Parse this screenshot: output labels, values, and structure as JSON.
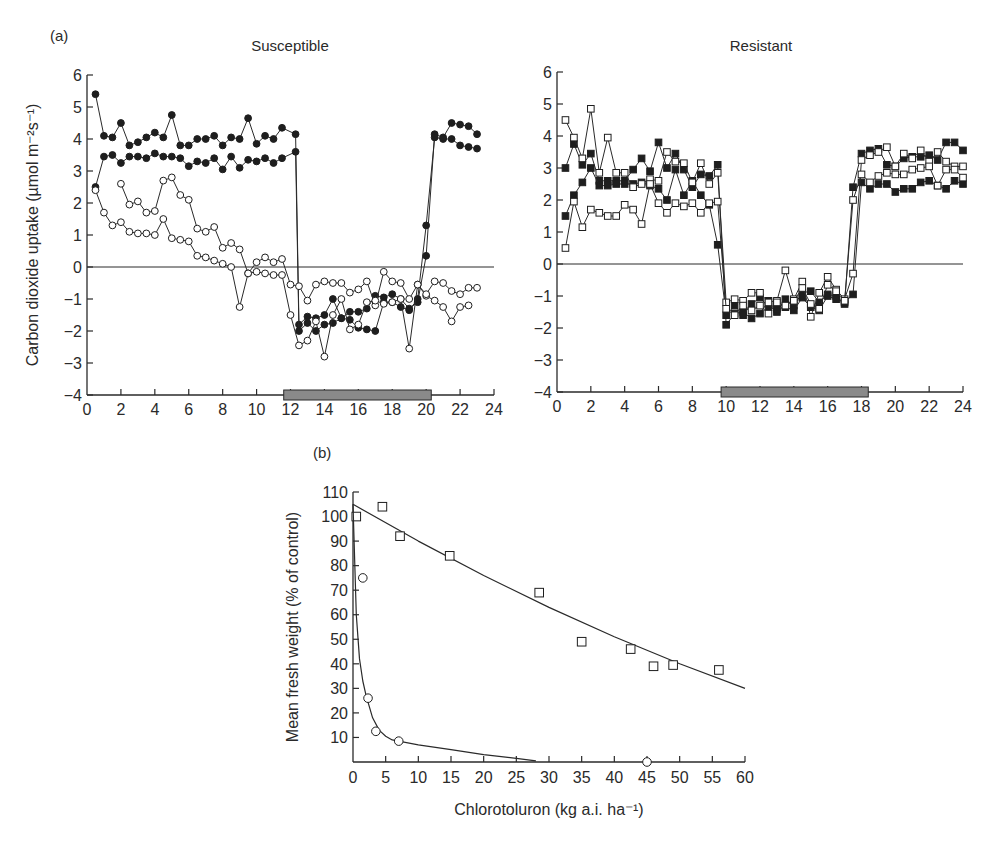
{
  "figure": {
    "panel_a_label": "(a)",
    "panel_b_label": "(b)"
  },
  "chart_data": [
    {
      "type": "line",
      "panel": "a-left",
      "title": "Susceptible",
      "ylabel": "Carbon dioxide uptake (µmol m⁻²s⁻¹)",
      "xlabel": "",
      "xlim": [
        0,
        24
      ],
      "ylim": [
        -4,
        6
      ],
      "xticks": [
        0,
        2,
        4,
        6,
        8,
        10,
        12,
        14,
        16,
        18,
        20,
        22,
        24
      ],
      "yticks": [
        6,
        5,
        4,
        3,
        2,
        1,
        0,
        -1,
        -2,
        -3,
        -4
      ],
      "dark_bar": [
        11.6,
        20.3
      ],
      "zero_line": true,
      "series": [
        {
          "name": "susceptible-filled-1",
          "marker": "filled-circle",
          "x": [
            0.5,
            1,
            1.5,
            2,
            2.5,
            3,
            3.5,
            4,
            4.5,
            5,
            5.5,
            6,
            6.5,
            7,
            7.5,
            8,
            8.5,
            9,
            9.5,
            10,
            10.5,
            11,
            11.5,
            12.3,
            12.5,
            13,
            13.5,
            14,
            14.5,
            15,
            15.5,
            16,
            16.5,
            17,
            17.5,
            18,
            18.5,
            19,
            19.5,
            20,
            20.5,
            21,
            21.5,
            22,
            22.5,
            23
          ],
          "y": [
            5.4,
            4.1,
            4.05,
            4.5,
            3.8,
            3.9,
            4.05,
            4.2,
            4.05,
            4.75,
            3.8,
            3.8,
            4.0,
            4.0,
            4.1,
            3.8,
            4.05,
            4.0,
            4.65,
            3.85,
            4.1,
            4.0,
            4.35,
            4.15,
            -1.8,
            -1.55,
            -1.6,
            -1.5,
            -1.0,
            -1.6,
            -1.4,
            -1.4,
            -1.3,
            -0.9,
            -0.95,
            -0.85,
            -1.0,
            -1.3,
            -1.1,
            0.35,
            4.15,
            4.05,
            4.5,
            4.45,
            4.4,
            4.15
          ]
        },
        {
          "name": "susceptible-filled-2",
          "marker": "filled-circle",
          "x": [
            0.5,
            1,
            1.5,
            2,
            2.5,
            3,
            3.5,
            4,
            4.5,
            5,
            5.5,
            6,
            6.5,
            7,
            7.5,
            8,
            8.5,
            9,
            9.5,
            10,
            10.5,
            11,
            11.5,
            12.3,
            12.5,
            13,
            13.5,
            14,
            14.5,
            15,
            15.5,
            16,
            16.5,
            17,
            17.5,
            18,
            18.5,
            19,
            19.5,
            20,
            20.5,
            21,
            21.5,
            22,
            22.5,
            23
          ],
          "y": [
            2.5,
            3.45,
            3.5,
            3.25,
            3.45,
            3.45,
            3.4,
            3.55,
            3.45,
            3.45,
            3.4,
            3.15,
            3.3,
            3.25,
            3.4,
            3.05,
            3.45,
            3.1,
            3.35,
            3.3,
            3.4,
            3.25,
            3.4,
            3.6,
            -2.0,
            -1.75,
            -2.0,
            -1.8,
            -1.75,
            -1.6,
            -1.65,
            -1.9,
            -1.95,
            -2.0,
            -1.1,
            -1.1,
            -1.25,
            -1.35,
            -1.0,
            1.3,
            4.05,
            4.0,
            4.0,
            3.8,
            3.75,
            3.7
          ]
        },
        {
          "name": "susceptible-open-1",
          "marker": "open-circle",
          "x": [
            2,
            2.5,
            3,
            3.5,
            4,
            4.5,
            5,
            5.5,
            6,
            6.5,
            7,
            7.5,
            8,
            8.5,
            9,
            9.5,
            10,
            10.5,
            11,
            11.5,
            12,
            12.5,
            13,
            13.5,
            14,
            14.5,
            15,
            15.5,
            16,
            16.5,
            17,
            17.5,
            18,
            18.5,
            19,
            19.5,
            20,
            20.5,
            21,
            21.5,
            22,
            22.5,
            23
          ],
          "y": [
            2.6,
            1.95,
            2.05,
            1.7,
            1.75,
            2.7,
            2.8,
            2.25,
            2.1,
            1.2,
            1.1,
            1.25,
            0.6,
            0.75,
            0.55,
            -0.2,
            0.15,
            0.3,
            0.15,
            0.25,
            -0.55,
            -0.6,
            -1.05,
            -0.55,
            -0.45,
            -0.5,
            -0.5,
            -0.8,
            -0.7,
            -0.45,
            -1.2,
            -0.15,
            -0.45,
            -0.5,
            -1.0,
            -0.55,
            -0.9,
            -1.05,
            -1.25,
            -1.7,
            -1.25,
            -1.2,
            null
          ]
        },
        {
          "name": "susceptible-open-2",
          "marker": "open-circle",
          "x": [
            0.5,
            1,
            1.5,
            2,
            2.5,
            3,
            3.5,
            4,
            4.5,
            5,
            5.5,
            6,
            6.5,
            7,
            7.5,
            8,
            8.5,
            9,
            9.5,
            10,
            10.5,
            11,
            11.5,
            12,
            12.5,
            13,
            13.5,
            14,
            14.5,
            15,
            15.5,
            16,
            16.5,
            17,
            17.5,
            18,
            18.5,
            19,
            19.5,
            20,
            20.5,
            21,
            21.5,
            22,
            22.5,
            23
          ],
          "y": [
            2.4,
            1.7,
            1.3,
            1.4,
            1.1,
            1.05,
            1.05,
            1.0,
            1.5,
            0.9,
            0.85,
            0.8,
            0.35,
            0.3,
            0.2,
            0.1,
            0.0,
            -1.25,
            -0.2,
            -0.15,
            -0.2,
            -0.25,
            -0.25,
            -1.5,
            -2.45,
            -2.3,
            -1.7,
            -2.8,
            -1.5,
            -1.0,
            -1.95,
            -1.8,
            -1.1,
            -1.05,
            -1.15,
            -1.1,
            -1.0,
            -2.55,
            -0.55,
            -0.85,
            -0.45,
            -0.5,
            -0.75,
            -0.85,
            -0.65,
            -0.65
          ]
        }
      ]
    },
    {
      "type": "line",
      "panel": "a-right",
      "title": "Resistant",
      "ylabel": "",
      "xlim": [
        0,
        24
      ],
      "ylim": [
        -4,
        6
      ],
      "xticks": [
        0,
        2,
        4,
        6,
        8,
        10,
        12,
        14,
        16,
        18,
        20,
        22,
        24
      ],
      "yticks": [
        6,
        5,
        4,
        3,
        2,
        1,
        0,
        -1,
        -2,
        -3,
        -4
      ],
      "dark_bar": [
        9.7,
        18.4
      ],
      "zero_line": true,
      "series": [
        {
          "name": "resistant-filled-1",
          "marker": "filled-square",
          "x": [
            0.5,
            1,
            1.5,
            2,
            2.5,
            3,
            3.5,
            4,
            4.5,
            5,
            5.5,
            6,
            6.5,
            7,
            7.5,
            8,
            8.5,
            9,
            9.5,
            10,
            10.5,
            11,
            11.5,
            12,
            12.5,
            13,
            13.5,
            14,
            14.5,
            15,
            15.5,
            16,
            16.5,
            17,
            17.5,
            18,
            18.5,
            19,
            19.5,
            20,
            20.5,
            21,
            21.5,
            22,
            22.5,
            23,
            23.5,
            24
          ],
          "y": [
            3.0,
            3.75,
            3.1,
            3.45,
            2.6,
            2.6,
            2.6,
            2.6,
            2.95,
            3.3,
            2.9,
            3.8,
            3.0,
            3.45,
            2.95,
            2.4,
            2.8,
            2.75,
            3.1,
            -1.9,
            -1.55,
            -1.5,
            -1.7,
            -1.55,
            -1.15,
            -1.5,
            -1.1,
            -1.3,
            -0.9,
            -0.85,
            -1.2,
            -0.95,
            -1.0,
            -1.25,
            2.4,
            3.45,
            3.55,
            3.6,
            3.1,
            3.05,
            3.3,
            3.35,
            3.35,
            3.4,
            3.25,
            3.8,
            3.8,
            3.55
          ]
        },
        {
          "name": "resistant-filled-2",
          "marker": "filled-square",
          "x": [
            0.5,
            1,
            1.5,
            2,
            2.5,
            3,
            3.5,
            4,
            4.5,
            5,
            5.5,
            6,
            6.5,
            7,
            7.5,
            8,
            8.5,
            9,
            9.5,
            10,
            10.5,
            11,
            11.5,
            12,
            12.5,
            13,
            13.5,
            14,
            14.5,
            15,
            15.5,
            16,
            16.5,
            17,
            17.5,
            18,
            18.5,
            19,
            19.5,
            20,
            20.5,
            21,
            21.5,
            22,
            22.5,
            23,
            23.5,
            24
          ],
          "y": [
            1.5,
            2.15,
            2.55,
            3.0,
            2.45,
            2.45,
            2.5,
            2.5,
            2.5,
            2.55,
            2.45,
            2.35,
            2.0,
            2.95,
            2.15,
            2.6,
            2.15,
            1.85,
            0.6,
            -1.6,
            -1.3,
            -1.6,
            -1.25,
            -1.05,
            -1.35,
            -1.4,
            -1.35,
            -1.45,
            -1.05,
            -1.35,
            -1.45,
            -1.0,
            -1.1,
            -1.2,
            -0.95,
            2.55,
            2.35,
            2.5,
            2.5,
            2.25,
            2.35,
            2.35,
            2.55,
            2.6,
            2.45,
            2.35,
            2.6,
            2.5
          ]
        },
        {
          "name": "resistant-open-1",
          "marker": "open-square",
          "x": [
            0.5,
            1,
            1.5,
            2,
            2.5,
            3,
            3.5,
            4,
            4.5,
            5,
            5.5,
            6,
            6.5,
            7,
            7.5,
            8,
            8.5,
            9,
            9.5,
            10,
            10.5,
            11,
            11.5,
            12,
            12.5,
            13,
            13.5,
            14,
            14.5,
            15,
            15.5,
            16,
            16.5,
            17,
            17.5,
            18,
            18.5,
            19,
            19.5,
            20,
            20.5,
            21,
            21.5,
            22,
            22.5,
            23,
            23.5,
            24
          ],
          "y": [
            4.5,
            3.95,
            3.3,
            4.85,
            2.85,
            3.95,
            2.85,
            2.85,
            2.4,
            2.5,
            2.65,
            2.6,
            3.5,
            3.2,
            3.15,
            2.55,
            3.15,
            2.5,
            2.85,
            -1.2,
            -1.1,
            -1.15,
            -0.9,
            -0.9,
            -1.2,
            -1.15,
            -0.2,
            -1.1,
            -0.55,
            -1.65,
            -0.9,
            -0.4,
            -0.8,
            -1.1,
            -0.3,
            3.25,
            3.4,
            3.5,
            3.65,
            3.05,
            3.45,
            3.3,
            3.55,
            3.2,
            3.5,
            3.2,
            3.05,
            3.05
          ]
        },
        {
          "name": "resistant-open-2",
          "marker": "open-square",
          "x": [
            0.5,
            1,
            1.5,
            2,
            2.5,
            3,
            3.5,
            4,
            4.5,
            5,
            5.5,
            6,
            6.5,
            7,
            7.5,
            8,
            8.5,
            9,
            9.5,
            10,
            10.5,
            11,
            11.5,
            12,
            12.5,
            13,
            13.5,
            14,
            14.5,
            15,
            15.5,
            16,
            16.5,
            17,
            17.5,
            18,
            18.5,
            19,
            19.5,
            20,
            20.5,
            21,
            21.5,
            22,
            22.5,
            23,
            23.5,
            24
          ],
          "y": [
            0.5,
            1.95,
            1.15,
            1.7,
            1.6,
            1.5,
            1.5,
            1.85,
            1.7,
            1.25,
            2.5,
            1.9,
            1.6,
            1.9,
            1.8,
            1.9,
            1.6,
            1.9,
            1.95,
            -1.4,
            -1.6,
            -1.3,
            -1.45,
            -1.3,
            -1.55,
            -1.2,
            -1.3,
            -1.15,
            -0.75,
            -1.25,
            -1.4,
            -0.65,
            -0.85,
            -1.15,
            2.0,
            2.8,
            2.55,
            2.75,
            2.85,
            2.8,
            2.8,
            2.95,
            3.0,
            3.05,
            2.45,
            2.95,
            2.95,
            2.7
          ]
        }
      ]
    },
    {
      "type": "scatter",
      "panel": "b",
      "title": "",
      "xlabel": "Chlorotoluron (kg a.i. ha⁻¹)",
      "ylabel": "Mean fresh weight (% of control)",
      "xlim": [
        0,
        60
      ],
      "ylim": [
        0,
        110
      ],
      "xticks": [
        0,
        5,
        10,
        15,
        20,
        25,
        30,
        35,
        40,
        45,
        50,
        55,
        60
      ],
      "yticks": [
        10,
        20,
        30,
        40,
        50,
        60,
        70,
        80,
        90,
        100,
        110
      ],
      "series": [
        {
          "name": "resistant",
          "marker": "open-square",
          "x": [
            0.5,
            4.5,
            7.2,
            14.8,
            28.5,
            35,
            42.5,
            46,
            49,
            56
          ],
          "y": [
            100,
            104,
            92,
            84,
            69,
            49,
            46,
            39,
            39.5,
            37.5
          ],
          "fit": {
            "x": [
              0,
              10,
              20,
              30,
              40,
              50,
              60
            ],
            "y": [
              105,
              90,
              76,
              63,
              51,
              40,
              30
            ]
          }
        },
        {
          "name": "susceptible",
          "marker": "open-circle",
          "x": [
            1.5,
            2.3,
            3.5,
            7,
            45
          ],
          "y": [
            75,
            26,
            12.5,
            8.5,
            0
          ],
          "fit": {
            "x": [
              0,
              0.5,
              1,
              1.5,
              2,
              3,
              4,
              5,
              6,
              7,
              10,
              15,
              20,
              25,
              28
            ],
            "y": [
              105,
              60,
              42,
              33,
              27,
              18,
              13,
              10.5,
              9,
              8.5,
              7,
              5,
              3,
              1.5,
              0.5
            ]
          }
        }
      ]
    }
  ]
}
